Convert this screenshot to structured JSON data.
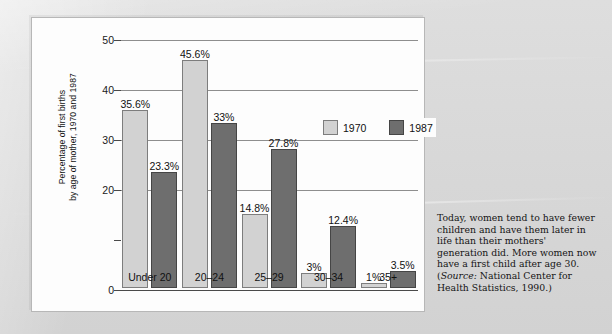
{
  "chart_data": {
    "type": "bar",
    "title": "",
    "xlabel": "",
    "ylabel_lines": [
      "Percentage of first births",
      "by age of mother, 1970 and 1987"
    ],
    "categories": [
      "Under 20",
      "20–24",
      "25–29",
      "30–34",
      "35+"
    ],
    "series": [
      {
        "name": "1970",
        "color": "#d2d2d2",
        "values": [
          35.6,
          45.6,
          14.8,
          3,
          1
        ],
        "labels": [
          "35.6%",
          "45.6%",
          "14.8%",
          "3%",
          "1%"
        ]
      },
      {
        "name": "1987",
        "color": "#6e6e6e",
        "values": [
          23.3,
          33,
          27.8,
          12.4,
          3.5
        ],
        "labels": [
          "23.3%",
          "33%",
          "27.8%",
          "12.4%",
          "3.5%"
        ]
      }
    ],
    "ylim": [
      0,
      50
    ],
    "yticks": [
      0,
      10,
      20,
      30,
      40,
      50
    ],
    "ytick_labels": [
      "0",
      "",
      "20",
      "30",
      "40",
      "50"
    ],
    "grid": true,
    "legend_position": "upper-right-inside"
  },
  "legend": {
    "items": [
      {
        "label": "1970",
        "swatch": "light"
      },
      {
        "label": "1987",
        "swatch": "dark"
      }
    ]
  },
  "caption": {
    "text_before_source": "Today, women tend to have fewer children and have them later in life than their mothers' generation did. More women now have a first child after age 30. (",
    "source_label": "Source:",
    "text_after_source": " National Center for Health Statistics, 1990.)"
  }
}
